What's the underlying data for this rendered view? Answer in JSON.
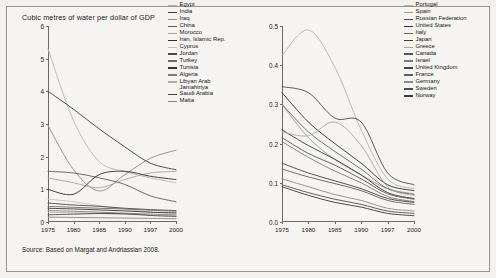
{
  "chart_title": "Cubic metres of water per dollar of GDP",
  "source_note": "Source: Based on Margat and Andriassian 2008.",
  "chart_data": [
    {
      "type": "line",
      "panel": "left",
      "title": "Cubic metres of water per dollar of GDP",
      "xlabel": "",
      "ylabel": "",
      "x": [
        1975,
        1980,
        1985,
        1990,
        1997,
        2000
      ],
      "xticklabels": [
        "1975",
        "1980",
        "1985",
        "1990",
        "1997",
        "2000"
      ],
      "yticklabels": [
        "0",
        "1",
        "2",
        "3",
        "4",
        "5",
        "6"
      ],
      "ylim": [
        0,
        6
      ],
      "grid": false,
      "legend_position": "right",
      "series": [
        {
          "name": "Egypt",
          "color": "#b9b5ae",
          "values": [
            5.3,
            3.1,
            1.85,
            1.55,
            1.35,
            1.2
          ]
        },
        {
          "name": "India",
          "color": "#3c3c3c",
          "values": [
            4.0,
            3.45,
            2.85,
            2.3,
            1.8,
            1.6
          ]
        },
        {
          "name": "Iraq",
          "color": "#8f8b85",
          "values": [
            2.95,
            1.6,
            0.95,
            1.45,
            1.95,
            2.2
          ]
        },
        {
          "name": "China",
          "color": "#5a5a5a",
          "values": [
            1.55,
            1.5,
            1.35,
            1.15,
            0.8,
            0.62
          ]
        },
        {
          "name": "Morocco",
          "color": "#a8a49d",
          "values": [
            1.35,
            1.2,
            1.05,
            1.3,
            1.5,
            1.55
          ]
        },
        {
          "name": "Iran, Islamic Rep.",
          "color": "#2e2e2e",
          "values": [
            1.0,
            0.85,
            1.45,
            1.55,
            1.4,
            1.3
          ]
        },
        {
          "name": "Cyprus",
          "color": "#c2beb7",
          "values": [
            0.7,
            0.62,
            0.5,
            0.4,
            0.3,
            0.26
          ]
        },
        {
          "name": "Jordan",
          "color": "#4a4a4a",
          "values": [
            0.58,
            0.52,
            0.48,
            0.42,
            0.38,
            0.35
          ]
        },
        {
          "name": "Turkey",
          "color": "#6e6a65",
          "values": [
            0.48,
            0.45,
            0.42,
            0.4,
            0.36,
            0.33
          ]
        },
        {
          "name": "Tunisia",
          "color": "#353535",
          "values": [
            0.42,
            0.4,
            0.37,
            0.34,
            0.3,
            0.28
          ]
        },
        {
          "name": "Algeria",
          "color": "#7d7973",
          "values": [
            0.35,
            0.33,
            0.3,
            0.27,
            0.24,
            0.22
          ]
        },
        {
          "name": "Libyan Arab Jamahiriya",
          "color": "#b0aca5",
          "values": [
            0.3,
            0.28,
            0.26,
            0.24,
            0.22,
            0.2
          ]
        },
        {
          "name": "Saudi Arabia",
          "color": "#454545",
          "values": [
            0.22,
            0.24,
            0.26,
            0.25,
            0.2,
            0.17
          ]
        },
        {
          "name": "Malta",
          "color": "#8a8680",
          "values": [
            0.15,
            0.14,
            0.13,
            0.12,
            0.11,
            0.1
          ]
        }
      ]
    },
    {
      "type": "line",
      "panel": "right",
      "title": "",
      "xlabel": "",
      "ylabel": "",
      "x": [
        1975,
        1980,
        1985,
        1990,
        1997,
        2000
      ],
      "xticklabels": [
        "1975",
        "1980",
        "1985",
        "1990",
        "1997",
        "2000"
      ],
      "yticklabels": [
        "0.0",
        "0.1",
        "0.2",
        "0.3",
        "0.4",
        "0.5"
      ],
      "ylim": [
        0.0,
        0.5
      ],
      "grid": false,
      "legend_position": "right",
      "series": [
        {
          "name": "Portugal",
          "color": "#b5b1aa",
          "values": [
            0.425,
            0.49,
            0.395,
            0.235,
            0.11,
            0.085
          ]
        },
        {
          "name": "Spain",
          "color": "#9e9a94",
          "values": [
            0.3,
            0.215,
            0.16,
            0.12,
            0.085,
            0.072
          ]
        },
        {
          "name": "Russian Federation",
          "color": "#4b4b4b",
          "values": [
            0.345,
            0.33,
            0.265,
            0.255,
            0.125,
            0.095
          ]
        },
        {
          "name": "United States",
          "color": "#2f2f2f",
          "values": [
            0.33,
            0.255,
            0.2,
            0.15,
            0.095,
            0.08
          ]
        },
        {
          "name": "Italy",
          "color": "#6a6660",
          "values": [
            0.3,
            0.23,
            0.18,
            0.135,
            0.085,
            0.07
          ]
        },
        {
          "name": "Japan",
          "color": "#3a3a3a",
          "values": [
            0.235,
            0.195,
            0.16,
            0.12,
            0.075,
            0.06
          ]
        },
        {
          "name": "Greece",
          "color": "#a9a59e",
          "values": [
            0.23,
            0.22,
            0.255,
            0.195,
            0.09,
            0.068
          ]
        },
        {
          "name": "Canada",
          "color": "#555555",
          "values": [
            0.215,
            0.175,
            0.145,
            0.11,
            0.072,
            0.058
          ]
        },
        {
          "name": "Israel",
          "color": "#7c7872",
          "values": [
            0.205,
            0.165,
            0.13,
            0.1,
            0.065,
            0.052
          ]
        },
        {
          "name": "United Kingdom",
          "color": "#424242",
          "values": [
            0.15,
            0.125,
            0.105,
            0.085,
            0.06,
            0.05
          ]
        },
        {
          "name": "France",
          "color": "#605c57",
          "values": [
            0.135,
            0.115,
            0.098,
            0.08,
            0.055,
            0.045
          ]
        },
        {
          "name": "Germany",
          "color": "#8e8a84",
          "values": [
            0.11,
            0.09,
            0.07,
            0.055,
            0.035,
            0.028
          ]
        },
        {
          "name": "Sweden",
          "color": "#4e4e4e",
          "values": [
            0.095,
            0.075,
            0.058,
            0.045,
            0.028,
            0.022
          ]
        },
        {
          "name": "Norway",
          "color": "#383838",
          "values": [
            0.09,
            0.068,
            0.05,
            0.038,
            0.022,
            0.016
          ]
        }
      ]
    }
  ]
}
